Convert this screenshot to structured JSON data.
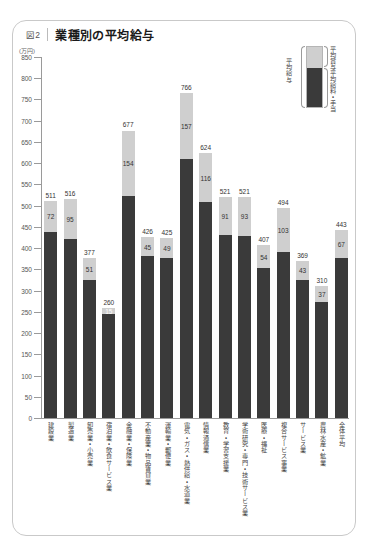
{
  "figure": {
    "number_label": "図2",
    "title": "業種別の平均給与"
  },
  "legend": {
    "total_label": "平均給与",
    "bonus_label": "平均賞与",
    "base_label": "平均給料・手当"
  },
  "chart_data": {
    "type": "bar",
    "stacked": true,
    "title": "業種別の平均給与",
    "xlabel": "",
    "ylabel": "(万円)",
    "ylim": [
      0,
      850
    ],
    "ytick_step": 50,
    "yticks": [
      0,
      50,
      100,
      150,
      200,
      250,
      300,
      350,
      400,
      450,
      500,
      550,
      600,
      650,
      700,
      750,
      800,
      850
    ],
    "grid": false,
    "legend_position": "top-right",
    "categories": [
      "建設業",
      "製造業",
      "卸売業・小売業",
      "宿泊業・飲食サービス業",
      "金融業・保険業",
      "不動産業・物品賃貸業",
      "運輸業・郵便業",
      "電気・ガス・熱供給・水道業",
      "情報通信業",
      "教育・学習支援業",
      "学術研究・専門・技術サービス業",
      "医療・福祉",
      "複合サービス事業",
      "サービス業",
      "農林水産・鉱業",
      "全体平均"
    ],
    "series": [
      {
        "name": "平均給料・手当",
        "color": "#3a3a3a",
        "values": [
          439,
          421,
          326,
          245,
          523,
          381,
          376,
          609,
          508,
          430,
          428,
          353,
          391,
          326,
          273,
          376
        ]
      },
      {
        "name": "平均賞与",
        "color": "#cfcfcf",
        "values": [
          72,
          95,
          51,
          15,
          154,
          45,
          49,
          157,
          116,
          91,
          93,
          54,
          103,
          43,
          37,
          67
        ]
      }
    ],
    "totals": [
      511,
      516,
      377,
      260,
      677,
      426,
      425,
      766,
      624,
      521,
      521,
      407,
      494,
      369,
      310,
      443
    ],
    "total_labels": [
      "511",
      "516",
      "377",
      "260",
      "677",
      "426",
      "425",
      "766",
      "624",
      "521",
      "521",
      "407",
      "494",
      "369",
      "310",
      "443"
    ],
    "bonus_labels": [
      "72",
      "95",
      "51",
      "15",
      "154",
      "45",
      "49",
      "157",
      "116",
      "91",
      "93",
      "54",
      "103",
      "43",
      "37",
      "67"
    ]
  }
}
